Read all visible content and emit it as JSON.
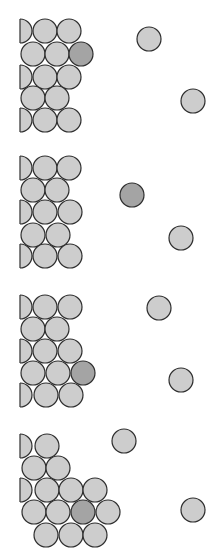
{
  "diagram": {
    "title": "",
    "colors": {
      "light_fill": "#cdcdcd",
      "dark_fill": "#a4a4a4",
      "outline": "#2e2e2e",
      "background": "#ffffff"
    },
    "radius": 12,
    "panels": [
      {
        "id": 1,
        "half_circles": [
          [
            20,
            31
          ],
          [
            20,
            77
          ],
          [
            20,
            120
          ]
        ],
        "lattice": [
          [
            45,
            31,
            "light"
          ],
          [
            69,
            31,
            "light"
          ],
          [
            33,
            54,
            "light"
          ],
          [
            57,
            54,
            "light"
          ],
          [
            81,
            54,
            "dark"
          ],
          [
            45,
            77,
            "light"
          ],
          [
            69,
            77,
            "light"
          ],
          [
            33,
            98,
            "light"
          ],
          [
            57,
            98,
            "light"
          ],
          [
            45,
            120,
            "light"
          ],
          [
            69,
            120,
            "light"
          ]
        ],
        "free": [
          [
            149,
            39,
            "light"
          ],
          [
            193,
            101,
            "light"
          ]
        ]
      },
      {
        "id": 2,
        "half_circles": [
          [
            20,
            168
          ],
          [
            20,
            212
          ],
          [
            20,
            256
          ]
        ],
        "lattice": [
          [
            45,
            168,
            "light"
          ],
          [
            69,
            168,
            "light"
          ],
          [
            33,
            190,
            "light"
          ],
          [
            57,
            190,
            "light"
          ],
          [
            45,
            212,
            "light"
          ],
          [
            70,
            212,
            "light"
          ],
          [
            33,
            235,
            "light"
          ],
          [
            58,
            235,
            "light"
          ],
          [
            45,
            256,
            "light"
          ],
          [
            70,
            256,
            "light"
          ]
        ],
        "free": [
          [
            132,
            195,
            "dark"
          ],
          [
            181,
            238,
            "light"
          ]
        ]
      },
      {
        "id": 3,
        "half_circles": [
          [
            20,
            307
          ],
          [
            20,
            351
          ],
          [
            20,
            395
          ]
        ],
        "lattice": [
          [
            45,
            307,
            "light"
          ],
          [
            70,
            307,
            "light"
          ],
          [
            33,
            329,
            "light"
          ],
          [
            57,
            329,
            "light"
          ],
          [
            45,
            351,
            "light"
          ],
          [
            70,
            351,
            "light"
          ],
          [
            33,
            373,
            "light"
          ],
          [
            58,
            373,
            "light"
          ],
          [
            83,
            373,
            "dark"
          ],
          [
            46,
            395,
            "light"
          ],
          [
            71,
            395,
            "light"
          ]
        ],
        "free": [
          [
            159,
            308,
            "light"
          ],
          [
            181,
            380,
            "light"
          ]
        ]
      },
      {
        "id": 4,
        "half_circles": [
          [
            20,
            446
          ],
          [
            20,
            490
          ]
        ],
        "lattice": [
          [
            47,
            446,
            "light"
          ],
          [
            34,
            468,
            "light"
          ],
          [
            58,
            468,
            "light"
          ],
          [
            47,
            490,
            "light"
          ],
          [
            71,
            490,
            "light"
          ],
          [
            95,
            490,
            "light"
          ],
          [
            34,
            512,
            "light"
          ],
          [
            58,
            512,
            "light"
          ],
          [
            83,
            512,
            "dark"
          ],
          [
            108,
            512,
            "light"
          ],
          [
            46,
            535,
            "light"
          ],
          [
            71,
            535,
            "light"
          ],
          [
            95,
            535,
            "light"
          ]
        ],
        "free": [
          [
            124,
            441,
            "light"
          ],
          [
            193,
            510,
            "light"
          ]
        ]
      }
    ]
  }
}
